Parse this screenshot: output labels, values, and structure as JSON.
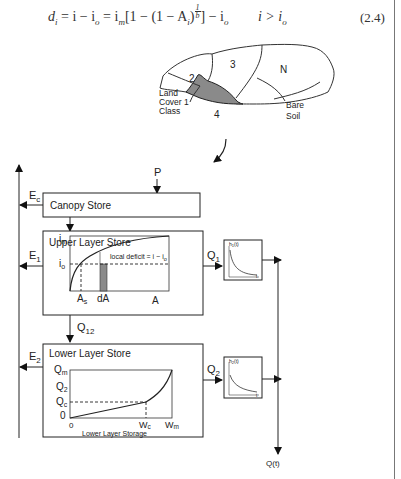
{
  "equation": {
    "lhs": "d",
    "lhs_sub": "i",
    "part1": " = i − i",
    "part1_sub": "o",
    "part2": " = i",
    "part2_sub": "m",
    "part3": "[1 − (1 − A",
    "part3_sub": "i",
    "part4": ")",
    "exp_num": "1",
    "exp_den": "b",
    "part5": "] − i",
    "part5_sub": "o",
    "condition": "i > i",
    "condition_sub": "o",
    "number": "(2.4)"
  },
  "catchment_map": {
    "regions": [
      {
        "id": "2",
        "label": "2"
      },
      {
        "id": "3",
        "label": "3"
      },
      {
        "id": "N",
        "label": "N"
      },
      {
        "id": "1",
        "label_lines": [
          "Land",
          "Cover 1",
          "Class"
        ]
      },
      {
        "id": "4",
        "label": "4",
        "highlighted": true
      },
      {
        "id": "bare",
        "label_lines": [
          "Bare",
          "Soil"
        ]
      }
    ],
    "highlight_color": "#8a8a8a"
  },
  "flows": {
    "precip": "P",
    "ec": "E",
    "ec_sub": "c",
    "e1": "E",
    "e1_sub": "1",
    "e2": "E",
    "e2_sub": "2",
    "q1": "Q",
    "q1_sub": "1",
    "q12": "Q",
    "q12_sub": "12",
    "q2": "Q",
    "q2_sub": "2",
    "qt": "Q(t)"
  },
  "canopy_store": {
    "title": "Canopy Store"
  },
  "upper_store": {
    "title": "Upper Layer Store",
    "y_top": "i",
    "y_top_sub": "m",
    "y_mid": "i",
    "y_mid_sub": "o",
    "x_as": "A",
    "x_as_sub": "s",
    "x_da": "dA",
    "x_a": "A",
    "annotation": "local deficit = i − i",
    "annotation_sub": "o"
  },
  "lower_store": {
    "title": "Lower Layer Store",
    "y_labels": [
      {
        "t": "Q",
        "s": "m"
      },
      {
        "t": "Q",
        "s": "2"
      },
      {
        "t": "Q",
        "s": "c"
      },
      {
        "t": "0",
        "s": ""
      }
    ],
    "x_labels": [
      {
        "t": "0",
        "s": ""
      },
      {
        "t": "W",
        "s": "c"
      },
      {
        "t": "W",
        "s": "m"
      }
    ],
    "x_title": "Lower Layer Storage"
  },
  "routing_1": {
    "y_label": "h",
    "y_sub": "1",
    "y_tail": "(t)",
    "x_label": "t"
  },
  "routing_2": {
    "y_label": "h",
    "y_sub": "2",
    "y_tail": "(t)",
    "x_label": "t"
  }
}
